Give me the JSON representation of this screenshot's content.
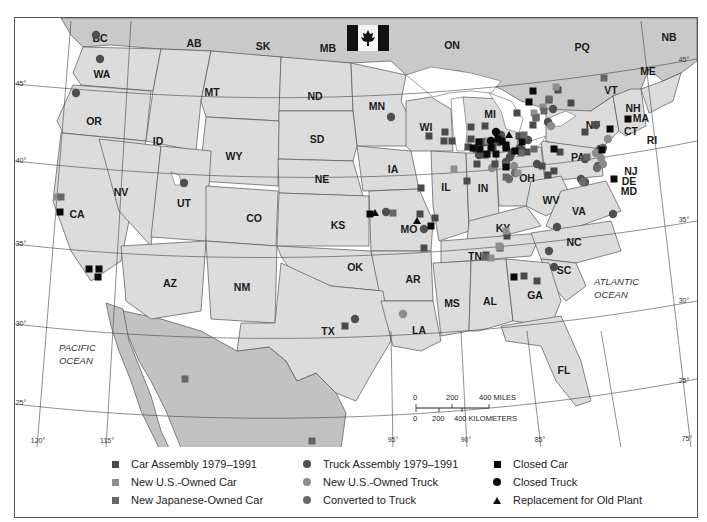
{
  "map": {
    "flag": "canada-flag-icon",
    "canada_provinces": [
      {
        "label": "BC",
        "x": 99,
        "y": 37
      },
      {
        "label": "AB",
        "x": 193,
        "y": 42
      },
      {
        "label": "SK",
        "x": 262,
        "y": 45
      },
      {
        "label": "MB",
        "x": 327,
        "y": 47
      },
      {
        "label": "ON",
        "x": 451,
        "y": 44
      },
      {
        "label": "PQ",
        "x": 581,
        "y": 46
      },
      {
        "label": "NB",
        "x": 668,
        "y": 36
      },
      {
        "label": "ME",
        "x": 647,
        "y": 70
      }
    ],
    "states": [
      {
        "label": "WA",
        "x": 101,
        "y": 73
      },
      {
        "label": "OR",
        "x": 93,
        "y": 120
      },
      {
        "label": "ID",
        "x": 157,
        "y": 140
      },
      {
        "label": "MT",
        "x": 211,
        "y": 91
      },
      {
        "label": "ND",
        "x": 314,
        "y": 95
      },
      {
        "label": "MN",
        "x": 376,
        "y": 105
      },
      {
        "label": "SD",
        "x": 316,
        "y": 138
      },
      {
        "label": "WY",
        "x": 233,
        "y": 155
      },
      {
        "label": "WI",
        "x": 425,
        "y": 126
      },
      {
        "label": "MI",
        "x": 489,
        "y": 113
      },
      {
        "label": "NY",
        "x": 592,
        "y": 124
      },
      {
        "label": "VT",
        "x": 610,
        "y": 89
      },
      {
        "label": "NH",
        "x": 632,
        "y": 107
      },
      {
        "label": "MA",
        "x": 640,
        "y": 117
      },
      {
        "label": "CT",
        "x": 630,
        "y": 130
      },
      {
        "label": "RI",
        "x": 651,
        "y": 139
      },
      {
        "label": "NV",
        "x": 120,
        "y": 191
      },
      {
        "label": "UT",
        "x": 183,
        "y": 202
      },
      {
        "label": "CO",
        "x": 253,
        "y": 217
      },
      {
        "label": "NE",
        "x": 321,
        "y": 178
      },
      {
        "label": "IA",
        "x": 392,
        "y": 168
      },
      {
        "label": "IL",
        "x": 445,
        "y": 186
      },
      {
        "label": "IN",
        "x": 482,
        "y": 187
      },
      {
        "label": "OH",
        "x": 526,
        "y": 177
      },
      {
        "label": "PA",
        "x": 577,
        "y": 156
      },
      {
        "label": "NJ",
        "x": 630,
        "y": 170
      },
      {
        "label": "DE",
        "x": 628,
        "y": 180
      },
      {
        "label": "MD",
        "x": 628,
        "y": 190
      },
      {
        "label": "CA",
        "x": 76,
        "y": 213
      },
      {
        "label": "KS",
        "x": 337,
        "y": 224
      },
      {
        "label": "MO",
        "x": 408,
        "y": 228
      },
      {
        "label": "KY",
        "x": 502,
        "y": 227
      },
      {
        "label": "WV",
        "x": 550,
        "y": 199
      },
      {
        "label": "VA",
        "x": 578,
        "y": 210
      },
      {
        "label": "AZ",
        "x": 169,
        "y": 282
      },
      {
        "label": "NM",
        "x": 241,
        "y": 286
      },
      {
        "label": "OK",
        "x": 354,
        "y": 266
      },
      {
        "label": "AR",
        "x": 412,
        "y": 278
      },
      {
        "label": "TN",
        "x": 474,
        "y": 255
      },
      {
        "label": "NC",
        "x": 573,
        "y": 241
      },
      {
        "label": "SC",
        "x": 563,
        "y": 269
      },
      {
        "label": "MS",
        "x": 451,
        "y": 302
      },
      {
        "label": "AL",
        "x": 489,
        "y": 300
      },
      {
        "label": "GA",
        "x": 534,
        "y": 294
      },
      {
        "label": "TX",
        "x": 327,
        "y": 330
      },
      {
        "label": "LA",
        "x": 418,
        "y": 329
      },
      {
        "label": "FL",
        "x": 563,
        "y": 369
      }
    ],
    "oceans": [
      {
        "line1": "PACIFIC",
        "line2": "OCEAN",
        "x": 58,
        "y": 350
      },
      {
        "line1": "ATLANTIC",
        "line2": "OCEAN",
        "x": 593,
        "y": 284
      }
    ],
    "latitude_ticks": [
      {
        "label": "45°",
        "x": 20,
        "y": 85
      },
      {
        "label": "40°",
        "x": 20,
        "y": 162
      },
      {
        "label": "35°",
        "x": 20,
        "y": 245
      },
      {
        "label": "30°",
        "x": 20,
        "y": 325
      },
      {
        "label": "25°",
        "x": 20,
        "y": 404
      },
      {
        "label": "45°",
        "x": 683,
        "y": 61
      },
      {
        "label": "35°",
        "x": 683,
        "y": 221
      },
      {
        "label": "30°",
        "x": 683,
        "y": 302
      },
      {
        "label": "25°",
        "x": 683,
        "y": 382
      }
    ],
    "longitude_ticks": [
      {
        "label": "120°",
        "x": 37,
        "y": 442
      },
      {
        "label": "115°",
        "x": 106,
        "y": 442
      },
      {
        "label": "95°",
        "x": 392,
        "y": 441
      },
      {
        "label": "90°",
        "x": 465,
        "y": 441
      },
      {
        "label": "85°",
        "x": 539,
        "y": 441
      },
      {
        "label": "75°",
        "x": 686,
        "y": 440
      }
    ],
    "scale_bar": {
      "miles_labels": [
        "0",
        "200",
        "400 MILES"
      ],
      "km_labels": [
        "0",
        "200",
        "400 KILOMETERS"
      ]
    },
    "markers": {
      "car_assembly": [
        [
          420,
          187
        ],
        [
          423,
          247
        ],
        [
          523,
          275
        ],
        [
          536,
          280
        ],
        [
          344,
          325
        ],
        [
          516,
          112
        ],
        [
          532,
          124
        ],
        [
          444,
          131
        ],
        [
          428,
          135
        ],
        [
          443,
          140
        ],
        [
          451,
          140
        ],
        [
          470,
          126
        ],
        [
          484,
          125
        ],
        [
          470,
          138
        ],
        [
          478,
          141
        ],
        [
          492,
          146
        ],
        [
          467,
          146
        ],
        [
          475,
          148
        ],
        [
          518,
          135
        ],
        [
          521,
          149
        ],
        [
          494,
          163
        ],
        [
          484,
          154
        ],
        [
          535,
          116
        ],
        [
          557,
          89
        ],
        [
          548,
          99
        ],
        [
          570,
          102
        ],
        [
          526,
          151
        ],
        [
          559,
          151
        ],
        [
          541,
          165
        ],
        [
          476,
          163
        ],
        [
          584,
          131
        ],
        [
          547,
          174
        ],
        [
          506,
          235
        ],
        [
          485,
          254
        ],
        [
          499,
          247
        ],
        [
          419,
          213
        ],
        [
          434,
          217
        ],
        [
          466,
          180
        ],
        [
          553,
          170
        ]
      ],
      "new_us_car": [
        [
          56,
          196
        ],
        [
          505,
          230
        ],
        [
          490,
          257
        ],
        [
          498,
          245
        ],
        [
          487,
          140
        ],
        [
          542,
          106
        ],
        [
          533,
          112
        ],
        [
          453,
          168
        ],
        [
          499,
          246
        ],
        [
          555,
          86
        ],
        [
          517,
          172
        ]
      ],
      "new_japanese_car": [
        [
          60,
          196
        ],
        [
          603,
          77
        ],
        [
          184,
          378
        ],
        [
          311,
          440
        ],
        [
          392,
          212
        ],
        [
          543,
          110
        ],
        [
          520,
          152
        ],
        [
          533,
          148
        ],
        [
          535,
          117
        ],
        [
          548,
          98
        ],
        [
          523,
          134
        ],
        [
          505,
          176
        ],
        [
          484,
          256
        ],
        [
          586,
          156
        ],
        [
          505,
          164
        ]
      ],
      "truck_assembly": [
        [
          95,
          34
        ],
        [
          99,
          58
        ],
        [
          75,
          92
        ],
        [
          183,
          182
        ],
        [
          390,
          116
        ],
        [
          385,
          211
        ],
        [
          423,
          228
        ],
        [
          354,
          318
        ],
        [
          548,
          250
        ],
        [
          556,
          226
        ],
        [
          553,
          266
        ],
        [
          478,
          154
        ],
        [
          484,
          141
        ],
        [
          498,
          141
        ],
        [
          500,
          134
        ],
        [
          505,
          161
        ],
        [
          511,
          152
        ],
        [
          519,
          147
        ],
        [
          527,
          139
        ],
        [
          547,
          121
        ],
        [
          552,
          108
        ],
        [
          536,
          163
        ],
        [
          612,
          213
        ],
        [
          595,
          124
        ],
        [
          599,
          148
        ],
        [
          584,
          158
        ],
        [
          597,
          165
        ],
        [
          584,
          181
        ],
        [
          580,
          178
        ],
        [
          509,
          156
        ]
      ],
      "new_us_truck": [
        [
          550,
          125
        ],
        [
          491,
          167
        ],
        [
          513,
          165
        ],
        [
          402,
          313
        ],
        [
          607,
          138
        ],
        [
          595,
          152
        ],
        [
          600,
          157
        ],
        [
          602,
          163
        ],
        [
          521,
          138
        ]
      ],
      "converted_truck": [
        [
          514,
          172
        ],
        [
          508,
          178
        ],
        [
          596,
          167
        ],
        [
          582,
          181
        ],
        [
          602,
          147
        ]
      ],
      "closed_car": [
        [
          59,
          211
        ],
        [
          88,
          268
        ],
        [
          98,
          268
        ],
        [
          97,
          276
        ],
        [
          369,
          213
        ],
        [
          430,
          225
        ],
        [
          553,
          148
        ],
        [
          528,
          101
        ],
        [
          513,
          276
        ],
        [
          613,
          178
        ],
        [
          627,
          118
        ],
        [
          609,
          128
        ],
        [
          478,
          141
        ],
        [
          490,
          147
        ],
        [
          501,
          140
        ],
        [
          486,
          153
        ],
        [
          495,
          153
        ],
        [
          479,
          148
        ],
        [
          472,
          147
        ],
        [
          505,
          144
        ],
        [
          505,
          166
        ],
        [
          514,
          150
        ],
        [
          497,
          138
        ],
        [
          532,
          90
        ],
        [
          505,
          147
        ],
        [
          521,
          141
        ],
        [
          601,
          149
        ]
      ],
      "closed_truck": [
        [
          490,
          140
        ],
        [
          495,
          131
        ]
      ],
      "replacement_old_plant": [
        [
          374,
          212
        ],
        [
          416,
          220
        ],
        [
          503,
          141
        ],
        [
          508,
          134
        ],
        [
          506,
          146
        ]
      ]
    },
    "colors": {
      "car_assembly": "#4a4a4a",
      "new_us_car": "#8f8f8f",
      "new_japanese_car": "#666666",
      "truck_assembly": "#4f4f4f",
      "new_us_truck": "#8c8c8c",
      "converted_truck": "#6a6a6a",
      "closed": "#0a0a0a",
      "us_land": "#dcdcdc",
      "canada_land": "#c9c9c9",
      "mexico_land": "#c2c2c2",
      "water": "#ffffff"
    }
  },
  "legend": {
    "col1": [
      {
        "label": "Car Assembly 1979–1991",
        "marker": "square",
        "color": "#4a4a4a"
      },
      {
        "label": "New U.S.-Owned Car",
        "marker": "square",
        "color": "#8f8f8f"
      },
      {
        "label": "New Japanese-Owned Car",
        "marker": "square",
        "color": "#666666"
      }
    ],
    "col2": [
      {
        "label": "Truck Assembly 1979–1991",
        "marker": "circle",
        "color": "#4f4f4f"
      },
      {
        "label": "New U.S.-Owned Truck",
        "marker": "circle",
        "color": "#8c8c8c"
      },
      {
        "label": "Converted to Truck",
        "marker": "circle",
        "color": "#6a6a6a"
      }
    ],
    "col3": [
      {
        "label": "Closed Car",
        "marker": "square",
        "color": "#0a0a0a"
      },
      {
        "label": "Closed Truck",
        "marker": "circle",
        "color": "#0a0a0a"
      },
      {
        "label": "Replacement for Old Plant",
        "marker": "triangle",
        "color": "#0a0a0a"
      }
    ]
  }
}
